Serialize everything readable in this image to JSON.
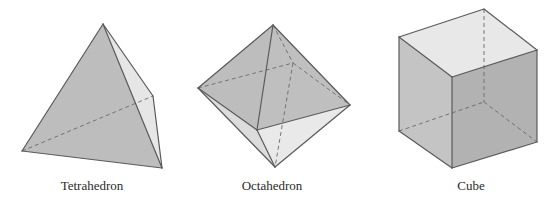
{
  "figures": [
    {
      "name": "Tetrahedron",
      "label": "Tetrahedron",
      "label_pos": [
        92,
        190
      ],
      "faces": [
        {
          "points": "103,24 153,96 162,168",
          "fill": "#e6e6e6"
        },
        {
          "points": "103,24 22,151 162,168",
          "fill": "#bdbdbd"
        }
      ],
      "edges": [
        "103,24 22,151",
        "103,24 162,168",
        "103,24 153,96",
        "153,96 162,168",
        "22,151 162,168"
      ],
      "hidden_edges": [
        "22,151 153,96"
      ]
    },
    {
      "name": "Octahedron",
      "label": "Octahedron",
      "label_pos": [
        272,
        190
      ],
      "faces": [
        {
          "points": "273,25 198,88 257,130",
          "fill": "#bdbdbd"
        },
        {
          "points": "273,25 257,130 350,105",
          "fill": "#bfbfbf"
        },
        {
          "points": "198,88 257,130 275,167",
          "fill": "#dcdcdc"
        },
        {
          "points": "257,130 350,105 275,167",
          "fill": "#e9e9e9"
        }
      ],
      "edges": [
        "273,25 198,88",
        "273,25 350,105",
        "273,25 257,130",
        "198,88 257,130",
        "257,130 350,105",
        "198,88 275,167",
        "350,105 275,167",
        "257,130 275,167"
      ],
      "hidden_edges": [
        "198,88 293,63",
        "293,63 350,105",
        "273,25 293,63",
        "293,63 275,167"
      ]
    },
    {
      "name": "Cube",
      "label": "Cube",
      "label_pos": [
        471,
        190
      ],
      "faces": [
        {
          "points": "399,37 484,9 537,50 452,77",
          "fill": "#e8e8e8"
        },
        {
          "points": "399,37 452,77 452,168 399,131",
          "fill": "#c4c4c4"
        },
        {
          "points": "452,77 537,50 537,142 452,168",
          "fill": "#b2b2b2"
        }
      ],
      "edges": [
        "399,37 484,9",
        "484,9 537,50",
        "537,50 452,77",
        "452,77 399,37",
        "399,37 399,131",
        "452,77 452,168",
        "537,50 537,142",
        "399,131 452,168",
        "452,168 537,142"
      ],
      "hidden_edges": [
        "484,9 484,102",
        "399,131 484,102",
        "484,102 537,142"
      ]
    }
  ]
}
